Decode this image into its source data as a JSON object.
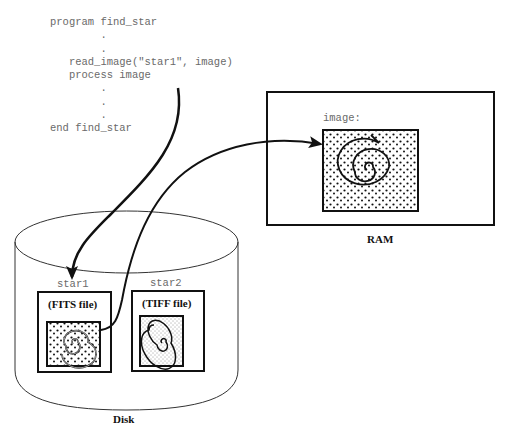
{
  "code": {
    "lines": [
      "program find_star",
      "        .",
      "        .",
      "   read_image(\"star1\", image)",
      "   process image",
      "        .",
      "        .",
      "        .",
      "end find_star"
    ]
  },
  "ram": {
    "label": "RAM",
    "variable_label": "image:"
  },
  "disk": {
    "label": "Disk",
    "files": [
      {
        "name": "star1",
        "type_label": "(FITS file)"
      },
      {
        "name": "star2",
        "type_label": "(TIFF file)"
      }
    ]
  },
  "arrows": [
    {
      "from": "read_image call",
      "to": "star1"
    },
    {
      "from": "star1 image",
      "to": "RAM image"
    }
  ]
}
